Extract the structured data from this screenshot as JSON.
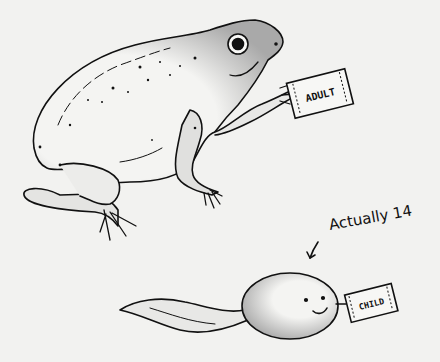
{
  "illustration": {
    "subject": "frog-and-tadpole-comic",
    "frog": {
      "tag_label": "ADULT"
    },
    "tadpole": {
      "tag_label": "CHILD"
    },
    "annotation": {
      "text": "Actually 14",
      "arrow": "arrow-down-left"
    },
    "colors": {
      "background": "#f2f2f0",
      "ink": "#111111",
      "shade": "#bdbdbd"
    }
  }
}
